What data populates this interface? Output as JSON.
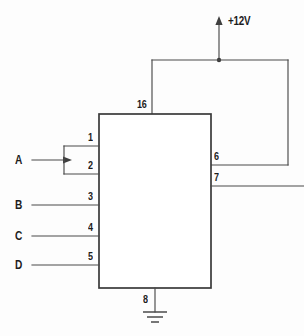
{
  "diagram": {
    "component": {
      "name": "ic-block",
      "pins": [
        {
          "number": "16",
          "side": "top",
          "function": "supply"
        },
        {
          "number": "1",
          "side": "left",
          "function": "input"
        },
        {
          "number": "2",
          "side": "left",
          "function": "input"
        },
        {
          "number": "3",
          "side": "left",
          "function": "input"
        },
        {
          "number": "4",
          "side": "left",
          "function": "input"
        },
        {
          "number": "5",
          "side": "left",
          "function": "input"
        },
        {
          "number": "6",
          "side": "right",
          "function": "output"
        },
        {
          "number": "7",
          "side": "right",
          "function": "output"
        },
        {
          "number": "8",
          "side": "bottom",
          "function": "ground"
        }
      ]
    },
    "signals": [
      {
        "name": "A",
        "pins": [
          "1",
          "2"
        ]
      },
      {
        "name": "B",
        "pins": [
          "3"
        ]
      },
      {
        "name": "C",
        "pins": [
          "4"
        ]
      },
      {
        "name": "D",
        "pins": [
          "5"
        ]
      }
    ],
    "supply": {
      "label": "+12V",
      "icon": "up-arrow-icon",
      "connected_pins": [
        "16",
        "6"
      ]
    },
    "ground": {
      "icon": "earth-ground-icon",
      "connected_pins": [
        "8"
      ]
    },
    "colors": {
      "wire": "#4a4a4a",
      "outline": "#3a3a3a",
      "text": "#1c1c1c",
      "background": "#fdfdfd"
    }
  }
}
